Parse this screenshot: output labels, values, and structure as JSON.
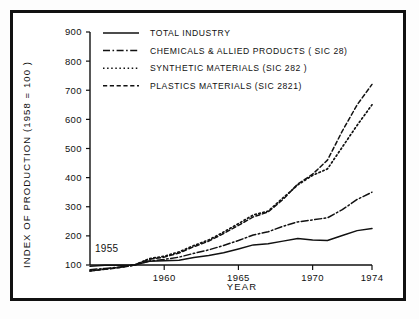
{
  "figure": {
    "frame_color": "#111111",
    "background": "#ffffff"
  },
  "axis": {
    "y_title": "INDEX OF PRODUCTION  (1958 = 100 )",
    "x_title": "YEAR",
    "y_ticks": [
      "100",
      "200",
      "300",
      "400",
      "500",
      "600",
      "700",
      "800",
      "900"
    ],
    "x_ticks": [
      "1960",
      "1965",
      "1970",
      "1974"
    ],
    "start_year_annotation": "1955"
  },
  "legend": {
    "items": [
      {
        "label": "TOTAL INDUSTRY",
        "style": "solid"
      },
      {
        "label": "CHEMICALS & ALLIED PRODUCTS ( SIC 28)",
        "style": "dashdot"
      },
      {
        "label": "SYNTHETIC MATERIALS  (SIC 282 )",
        "style": "dotted"
      },
      {
        "label": "PLASTICS MATERIALS (SIC 2821)",
        "style": "dashed"
      }
    ]
  },
  "chart_data": {
    "type": "line",
    "title": "",
    "xlabel": "YEAR",
    "ylabel": "INDEX OF PRODUCTION  (1958 = 100 )",
    "xlim": [
      1955,
      1974
    ],
    "ylim": [
      100,
      900
    ],
    "ytick_values": [
      100,
      200,
      300,
      400,
      500,
      600,
      700,
      800,
      900
    ],
    "xtick_values": [
      1960,
      1965,
      1970,
      1974
    ],
    "grid": false,
    "legend_position": "top-center",
    "x": [
      1955,
      1956,
      1957,
      1958,
      1959,
      1960,
      1961,
      1962,
      1963,
      1964,
      1965,
      1966,
      1967,
      1968,
      1969,
      1970,
      1971,
      1972,
      1973,
      1974
    ],
    "series": [
      {
        "name": "TOTAL INDUSTRY",
        "style": "solid",
        "values": [
          96,
          99,
          99,
          100,
          113,
          115,
          116,
          126,
          133,
          142,
          155,
          169,
          173,
          182,
          191,
          186,
          184,
          201,
          218,
          225
        ]
      },
      {
        "name": "CHEMICALS & ALLIED PRODUCTS ( SIC 28)",
        "style": "dashdot",
        "values": [
          84,
          88,
          93,
          100,
          114,
          119,
          127,
          140,
          152,
          167,
          184,
          203,
          214,
          233,
          248,
          255,
          262,
          290,
          325,
          350
        ]
      },
      {
        "name": "SYNTHETIC MATERIALS  (SIC 282 )",
        "style": "dotted",
        "values": [
          80,
          86,
          92,
          100,
          122,
          130,
          145,
          167,
          186,
          213,
          242,
          272,
          285,
          330,
          375,
          408,
          430,
          505,
          580,
          650
        ]
      },
      {
        "name": "PLASTICS MATERIALS (SIC 2821)",
        "style": "dashed",
        "values": [
          79,
          85,
          91,
          100,
          120,
          127,
          141,
          163,
          182,
          208,
          236,
          265,
          282,
          325,
          378,
          412,
          460,
          560,
          650,
          720
        ]
      }
    ]
  }
}
